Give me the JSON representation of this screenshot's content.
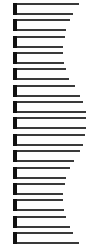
{
  "diagram": {
    "background": "#ffffff",
    "bar_color": "#111111",
    "line_color": "#3a3a3a",
    "units": [
      {
        "top_end": 79,
        "bottom_end": 73
      },
      {
        "top_end": 70,
        "bottom_end": 66
      },
      {
        "top_end": 65,
        "bottom_end": 63
      },
      {
        "top_end": 63,
        "bottom_end": 64
      },
      {
        "top_end": 66,
        "bottom_end": 69
      },
      {
        "top_end": 75,
        "bottom_end": 80
      },
      {
        "top_end": 83,
        "bottom_end": 86
      },
      {
        "top_end": 86,
        "bottom_end": 86
      },
      {
        "top_end": 85,
        "bottom_end": 83
      },
      {
        "top_end": 80,
        "bottom_end": 74
      },
      {
        "top_end": 70,
        "bottom_end": 66
      },
      {
        "top_end": 65,
        "bottom_end": 63
      },
      {
        "top_end": 63,
        "bottom_end": 64
      },
      {
        "top_end": 66,
        "bottom_end": 70
      },
      {
        "top_end": 73,
        "bottom_end": 79
      }
    ]
  }
}
